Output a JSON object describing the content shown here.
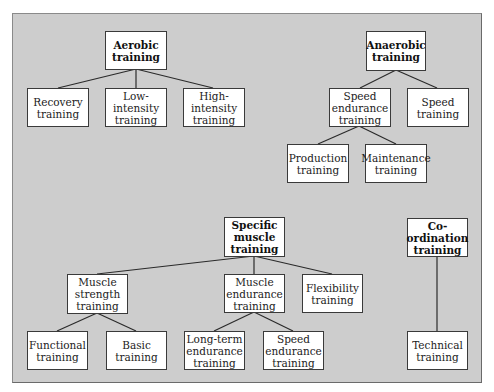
{
  "diagram": {
    "background_color": "#cdcdcd",
    "node_fill": "#ffffff",
    "line_color": "#2a2a2a",
    "trees": [
      {
        "name": "aerobic",
        "root": {
          "id": "aerobic",
          "label": "Aerobic\ntraining"
        },
        "children": [
          {
            "id": "recovery",
            "label": "Recovery\ntraining"
          },
          {
            "id": "low-intensity",
            "label": "Low-\nintensity\ntraining"
          },
          {
            "id": "high-intensity",
            "label": "High-\nintensity\ntraining"
          }
        ]
      },
      {
        "name": "anaerobic",
        "root": {
          "id": "anaerobic",
          "label": "Anaerobic\ntraining"
        },
        "children": [
          {
            "id": "speed-endurance-anaerobic",
            "label": "Speed\nendurance\ntraining",
            "children": [
              {
                "id": "production",
                "label": "Production\ntraining"
              },
              {
                "id": "maintenance",
                "label": "Maintenance\ntraining"
              }
            ]
          },
          {
            "id": "speed",
            "label": "Speed\ntraining"
          }
        ]
      },
      {
        "name": "specific-muscle",
        "root": {
          "id": "specific-muscle",
          "label": "Specific\nmuscle\ntraining"
        },
        "children": [
          {
            "id": "muscle-strength",
            "label": "Muscle\nstrength\ntraining",
            "children": [
              {
                "id": "functional",
                "label": "Functional\ntraining"
              },
              {
                "id": "basic",
                "label": "Basic\ntraining"
              }
            ]
          },
          {
            "id": "muscle-endurance",
            "label": "Muscle\nendurance\ntraining",
            "children": [
              {
                "id": "long-term-endurance",
                "label": "Long-term\nendurance\ntraining"
              },
              {
                "id": "speed-endurance-muscle",
                "label": "Speed\nendurance\ntraining"
              }
            ]
          },
          {
            "id": "flexibility",
            "label": "Flexibility\ntraining"
          }
        ]
      },
      {
        "name": "co-ordination",
        "root": {
          "id": "co-ordination",
          "label": "Co-\nordination\ntraining"
        },
        "children": [
          {
            "id": "technical",
            "label": "Technical\ntraining"
          }
        ]
      }
    ]
  }
}
